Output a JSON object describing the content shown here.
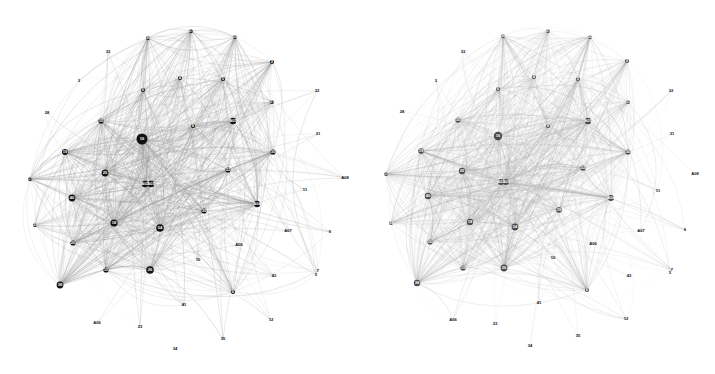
{
  "figure": {
    "title": "",
    "background_color": "#ffffff",
    "panel_count": 2
  },
  "chart_data": {
    "type": "scatter",
    "title": "",
    "subtitle": "",
    "xlabel": "",
    "ylabel": "",
    "grid": false,
    "legend_position": "none",
    "panels": [
      {
        "name": "left-network",
        "node_color": "#121212",
        "edge_color": "#9a9a9a",
        "node_count": 49,
        "nodes": [
          {
            "id": "36",
            "label": "36",
            "x": 148,
            "y": 38,
            "r": 2.1
          },
          {
            "id": "27",
            "label": "27",
            "x": 191,
            "y": 31,
            "r": 2.1
          },
          {
            "id": "25",
            "label": "25",
            "x": 235,
            "y": 37,
            "r": 2.1
          },
          {
            "id": "33",
            "label": "33",
            "x": 108,
            "y": 52,
            "r": 0.0
          },
          {
            "id": "2",
            "label": "2",
            "x": 272,
            "y": 62,
            "r": 2.1
          },
          {
            "id": "3",
            "label": "3",
            "x": 79,
            "y": 81,
            "r": 0.0
          },
          {
            "id": "4",
            "label": "4",
            "x": 180,
            "y": 78,
            "r": 2.1
          },
          {
            "id": "5",
            "label": "5",
            "x": 223,
            "y": 79,
            "r": 2.1
          },
          {
            "id": "32",
            "label": "32",
            "x": 317,
            "y": 91,
            "r": 0.0
          },
          {
            "id": "6",
            "label": "6",
            "x": 143,
            "y": 90,
            "r": 2.1
          },
          {
            "id": "37",
            "label": "37",
            "x": 272,
            "y": 102,
            "r": 2.1
          },
          {
            "id": "28",
            "label": "28",
            "x": 47,
            "y": 113,
            "r": 0.0
          },
          {
            "id": "35",
            "label": "35",
            "x": 101,
            "y": 121,
            "r": 2.6
          },
          {
            "id": "8",
            "label": "8",
            "x": 193,
            "y": 126,
            "r": 2.1
          },
          {
            "id": "A01",
            "label": "A01",
            "x": 233,
            "y": 121,
            "r": 3.2
          },
          {
            "id": "31",
            "label": "31",
            "x": 318,
            "y": 134,
            "r": 0.0
          },
          {
            "id": "16",
            "label": "16",
            "x": 142,
            "y": 139,
            "r": 5.5
          },
          {
            "id": "19",
            "label": "19",
            "x": 65,
            "y": 152,
            "r": 3.0
          },
          {
            "id": "30",
            "label": "30",
            "x": 273,
            "y": 152,
            "r": 2.6
          },
          {
            "id": "17",
            "label": "17",
            "x": 30,
            "y": 179,
            "r": 2.1
          },
          {
            "id": "25b",
            "label": "25",
            "x": 105,
            "y": 173,
            "r": 3.4
          },
          {
            "id": "A03",
            "label": "A03",
            "x": 151,
            "y": 184,
            "r": 3.2
          },
          {
            "id": "22",
            "label": "22",
            "x": 228,
            "y": 170,
            "r": 2.6
          },
          {
            "id": "A08",
            "label": "A08",
            "x": 345,
            "y": 178,
            "r": 0.0
          },
          {
            "id": "11",
            "label": "11",
            "x": 305,
            "y": 190,
            "r": 0.0
          },
          {
            "id": "A02",
            "label": "A02",
            "x": 145,
            "y": 184,
            "r": 3.2
          },
          {
            "id": "40",
            "label": "40",
            "x": 72,
            "y": 198,
            "r": 3.4
          },
          {
            "id": "39",
            "label": "39",
            "x": 35,
            "y": 225,
            "r": 2.1
          },
          {
            "id": "18",
            "label": "18",
            "x": 114,
            "y": 223,
            "r": 3.6
          },
          {
            "id": "54",
            "label": "54",
            "x": 160,
            "y": 228,
            "r": 3.8
          },
          {
            "id": "39b",
            "label": "39",
            "x": 204,
            "y": 211,
            "r": 2.6
          },
          {
            "id": "A04",
            "label": "A04",
            "x": 257,
            "y": 204,
            "r": 3.2
          },
          {
            "id": "A07",
            "label": "A07",
            "x": 288,
            "y": 231,
            "r": 0.0
          },
          {
            "id": "9",
            "label": "9",
            "x": 330,
            "y": 232,
            "r": 0.0
          },
          {
            "id": "20",
            "label": "20",
            "x": 73,
            "y": 243,
            "r": 2.6
          },
          {
            "id": "A06b",
            "label": "A06",
            "x": 239,
            "y": 245,
            "r": 0.0
          },
          {
            "id": "10",
            "label": "10",
            "x": 198,
            "y": 260,
            "r": 0.0
          },
          {
            "id": "43",
            "label": "43",
            "x": 274,
            "y": 276,
            "r": 0.0
          },
          {
            "id": "3b",
            "label": "3",
            "x": 316,
            "y": 275,
            "r": 0.0
          },
          {
            "id": "26",
            "label": "26",
            "x": 150,
            "y": 270,
            "r": 3.8
          },
          {
            "id": "15",
            "label": "15",
            "x": 106,
            "y": 270,
            "r": 2.6
          },
          {
            "id": "38",
            "label": "38",
            "x": 60,
            "y": 285,
            "r": 3.4
          },
          {
            "id": "6b",
            "label": "6",
            "x": 233,
            "y": 292,
            "r": 2.1
          },
          {
            "id": "7",
            "label": "7",
            "x": 318,
            "y": 271,
            "r": 0.0
          },
          {
            "id": "41",
            "label": "41",
            "x": 184,
            "y": 305,
            "r": 0.0
          },
          {
            "id": "12",
            "label": "12",
            "x": 271,
            "y": 320,
            "r": 0.0
          },
          {
            "id": "A05",
            "label": "A06",
            "x": 97,
            "y": 323,
            "r": 0.0
          },
          {
            "id": "23",
            "label": "23",
            "x": 140,
            "y": 327,
            "r": 0.0
          },
          {
            "id": "34",
            "label": "34",
            "x": 175,
            "y": 349,
            "r": 0.0
          },
          {
            "id": "35b",
            "label": "35",
            "x": 223,
            "y": 339,
            "r": 0.0
          }
        ]
      },
      {
        "name": "right-network",
        "node_color": "#4a4a4a",
        "edge_color": "#b0b0b0",
        "node_count": 49,
        "nodes": [
          {
            "id": "36",
            "label": "36",
            "x": 145,
            "y": 36,
            "r": 2.1
          },
          {
            "id": "27",
            "label": "27",
            "x": 190,
            "y": 31,
            "r": 2.1
          },
          {
            "id": "25",
            "label": "25",
            "x": 232,
            "y": 37,
            "r": 2.1
          },
          {
            "id": "33",
            "label": "33",
            "x": 105,
            "y": 52,
            "r": 0.0
          },
          {
            "id": "2",
            "label": "2",
            "x": 269,
            "y": 61,
            "r": 2.1
          },
          {
            "id": "3",
            "label": "3",
            "x": 78,
            "y": 81,
            "r": 0.0
          },
          {
            "id": "4",
            "label": "4",
            "x": 176,
            "y": 77,
            "r": 2.1
          },
          {
            "id": "5",
            "label": "5",
            "x": 220,
            "y": 79,
            "r": 2.1
          },
          {
            "id": "32",
            "label": "32",
            "x": 313,
            "y": 91,
            "r": 0.0
          },
          {
            "id": "6",
            "label": "6",
            "x": 140,
            "y": 89,
            "r": 2.1
          },
          {
            "id": "37",
            "label": "37",
            "x": 270,
            "y": 102,
            "r": 2.1
          },
          {
            "id": "28",
            "label": "28",
            "x": 44,
            "y": 112,
            "r": 0.0
          },
          {
            "id": "35",
            "label": "35",
            "x": 100,
            "y": 120,
            "r": 2.6
          },
          {
            "id": "8",
            "label": "8",
            "x": 190,
            "y": 126,
            "r": 2.1
          },
          {
            "id": "A01",
            "label": "A01",
            "x": 230,
            "y": 121,
            "r": 3.2
          },
          {
            "id": "31",
            "label": "31",
            "x": 314,
            "y": 134,
            "r": 0.0
          },
          {
            "id": "16",
            "label": "16",
            "x": 140,
            "y": 136,
            "r": 4.2
          },
          {
            "id": "19",
            "label": "19",
            "x": 63,
            "y": 151,
            "r": 2.8
          },
          {
            "id": "30",
            "label": "30",
            "x": 270,
            "y": 152,
            "r": 2.6
          },
          {
            "id": "17",
            "label": "17",
            "x": 28,
            "y": 174,
            "r": 2.1
          },
          {
            "id": "25b",
            "label": "25",
            "x": 104,
            "y": 171,
            "r": 3.2
          },
          {
            "id": "A03",
            "label": "A03",
            "x": 148,
            "y": 182,
            "r": 3.0
          },
          {
            "id": "22",
            "label": "22",
            "x": 225,
            "y": 168,
            "r": 2.6
          },
          {
            "id": "A08",
            "label": "A08",
            "x": 337,
            "y": 174,
            "r": 0.0
          },
          {
            "id": "11",
            "label": "11",
            "x": 300,
            "y": 191,
            "r": 0.0
          },
          {
            "id": "A02",
            "label": "A02",
            "x": 143,
            "y": 182,
            "r": 3.0
          },
          {
            "id": "40",
            "label": "40",
            "x": 70,
            "y": 196,
            "r": 3.2
          },
          {
            "id": "39",
            "label": "39",
            "x": 33,
            "y": 223,
            "r": 2.1
          },
          {
            "id": "18",
            "label": "18",
            "x": 112,
            "y": 222,
            "r": 3.2
          },
          {
            "id": "54",
            "label": "54",
            "x": 157,
            "y": 227,
            "r": 3.4
          },
          {
            "id": "39b",
            "label": "39",
            "x": 201,
            "y": 210,
            "r": 2.8
          },
          {
            "id": "A04",
            "label": "A04",
            "x": 253,
            "y": 198,
            "r": 3.0
          },
          {
            "id": "A07",
            "label": "A07",
            "x": 283,
            "y": 231,
            "r": 0.0
          },
          {
            "id": "9",
            "label": "9",
            "x": 327,
            "y": 230,
            "r": 0.0
          },
          {
            "id": "20",
            "label": "20",
            "x": 72,
            "y": 242,
            "r": 2.6
          },
          {
            "id": "A06b",
            "label": "A06",
            "x": 235,
            "y": 244,
            "r": 0.0
          },
          {
            "id": "10",
            "label": "10",
            "x": 195,
            "y": 258,
            "r": 0.0
          },
          {
            "id": "43",
            "label": "43",
            "x": 271,
            "y": 276,
            "r": 0.0
          },
          {
            "id": "3b",
            "label": "3",
            "x": 312,
            "y": 273,
            "r": 0.0
          },
          {
            "id": "26",
            "label": "26",
            "x": 146,
            "y": 268,
            "r": 3.4
          },
          {
            "id": "15",
            "label": "15",
            "x": 105,
            "y": 268,
            "r": 2.6
          },
          {
            "id": "38",
            "label": "38",
            "x": 59,
            "y": 283,
            "r": 3.2
          },
          {
            "id": "6b",
            "label": "6",
            "x": 229,
            "y": 290,
            "r": 2.1
          },
          {
            "id": "7",
            "label": "7",
            "x": 314,
            "y": 270,
            "r": 0.0
          },
          {
            "id": "41",
            "label": "41",
            "x": 181,
            "y": 303,
            "r": 0.0
          },
          {
            "id": "12",
            "label": "12",
            "x": 268,
            "y": 319,
            "r": 0.0
          },
          {
            "id": "A05",
            "label": "A06",
            "x": 95,
            "y": 320,
            "r": 0.0
          },
          {
            "id": "23",
            "label": "23",
            "x": 137,
            "y": 324,
            "r": 0.0
          },
          {
            "id": "34",
            "label": "34",
            "x": 172,
            "y": 346,
            "r": 0.0
          },
          {
            "id": "35b",
            "label": "35",
            "x": 220,
            "y": 336,
            "r": 0.0
          }
        ]
      }
    ]
  }
}
